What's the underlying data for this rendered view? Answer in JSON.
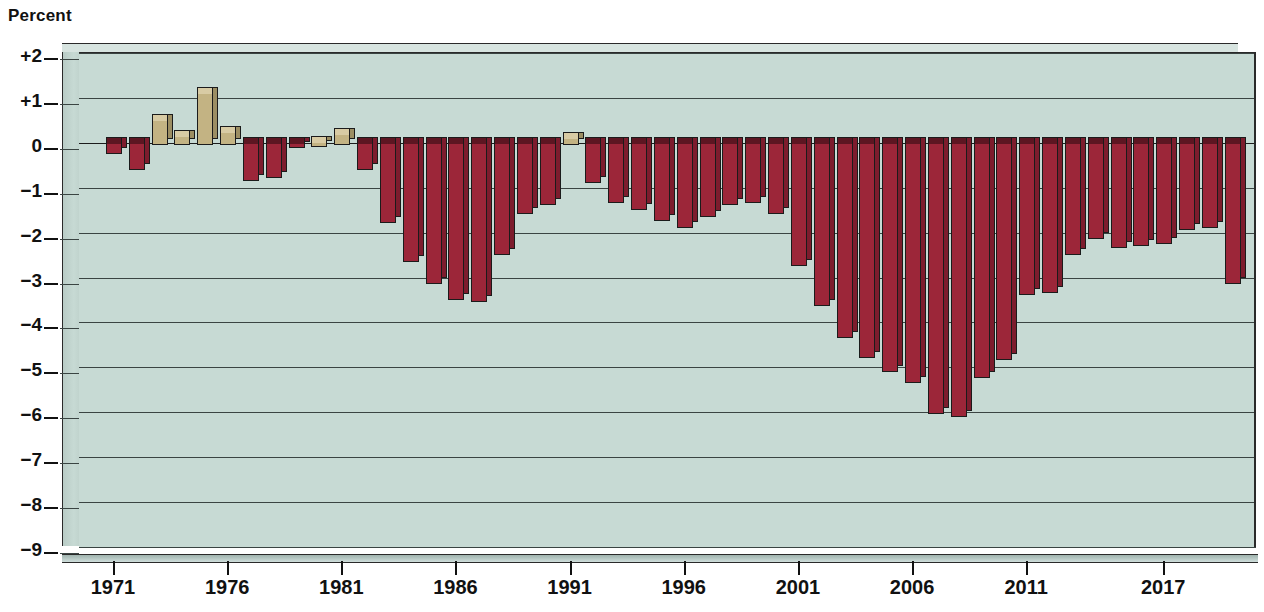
{
  "chart_data": {
    "type": "bar",
    "title": "",
    "ylabel": "Percent",
    "xlabel": "",
    "ylim": [
      -9,
      2
    ],
    "grid": true,
    "legend": false,
    "ytick_labels": [
      "+2",
      "+1",
      "0",
      "−1",
      "−2",
      "−3",
      "−4",
      "−5",
      "−6",
      "−7",
      "−8",
      "−9"
    ],
    "ytick_values": [
      2,
      1,
      0,
      -1,
      -2,
      -3,
      -4,
      -5,
      -6,
      -7,
      -8,
      -9
    ],
    "xtick_labels": [
      "1971",
      "1976",
      "1981",
      "1986",
      "1991",
      "1996",
      "2001",
      "2006",
      "2011",
      "2017"
    ],
    "xtick_values": [
      1971,
      1976,
      1981,
      1986,
      1991,
      1996,
      2001,
      2006,
      2011,
      2017
    ],
    "positive_color": "#c3b383",
    "negative_color": "#9c2639",
    "plot_background": "#c7dad4",
    "categories": [
      1971,
      1972,
      1973,
      1974,
      1975,
      1976,
      1977,
      1978,
      1979,
      1980,
      1981,
      1982,
      1983,
      1984,
      1985,
      1986,
      1987,
      1988,
      1989,
      1990,
      1991,
      1992,
      1993,
      1994,
      1995,
      1996,
      1997,
      1998,
      1999,
      2000,
      2001,
      2002,
      2003,
      2004,
      2005,
      2006,
      2007,
      2008,
      2009,
      2010,
      2011,
      2012,
      2013,
      2014,
      2015,
      2016,
      2017,
      2018,
      2019,
      2020
    ],
    "values": [
      -0.2,
      -0.55,
      0.5,
      0.15,
      1.1,
      0.25,
      -0.8,
      -0.75,
      -0.05,
      0.02,
      0.2,
      -0.55,
      -1.75,
      -2.6,
      -3.1,
      -3.45,
      -3.5,
      -2.45,
      -1.55,
      -1.35,
      0.1,
      -0.85,
      -1.3,
      -1.45,
      -1.7,
      -1.85,
      -1.6,
      -1.35,
      -1.3,
      -1.55,
      -2.7,
      -3.6,
      -4.3,
      -4.75,
      -5.05,
      -5.3,
      -6.0,
      -6.05,
      -5.2,
      -4.8,
      -3.35,
      -3.3,
      -2.45,
      -2.1,
      -2.3,
      -2.25,
      -2.2,
      -1.9,
      -1.85,
      -3.1
    ],
    "series_name": "Federal budget surplus or deficit as percent of GDP"
  }
}
